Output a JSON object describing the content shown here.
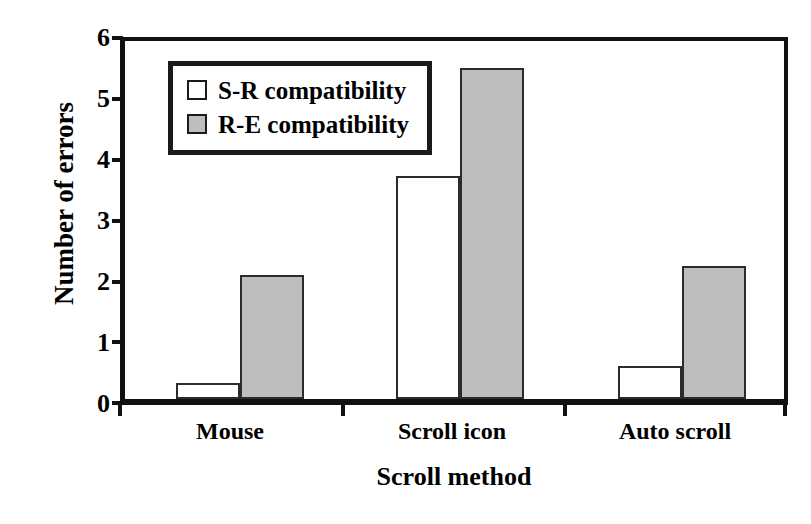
{
  "chart_data": {
    "type": "bar",
    "title": "",
    "xlabel": "Scroll method",
    "ylabel": "Number of errors",
    "categories": [
      "Mouse",
      "Scroll icon",
      "Auto scroll"
    ],
    "series": [
      {
        "name": "S-R compatibility",
        "values": [
          0.26,
          3.65,
          0.53
        ],
        "color": "#ffffff"
      },
      {
        "name": "R-E compatibility",
        "values": [
          2.02,
          5.42,
          2.18
        ],
        "color": "#bebebe"
      }
    ],
    "ylim": [
      0,
      6
    ],
    "yticks": [
      0,
      1,
      2,
      3,
      4,
      5,
      6
    ],
    "ytick_labels": [
      "0",
      "1",
      "2",
      "3",
      "4",
      "5",
      "6"
    ],
    "grid": false,
    "legend_position": "top-left-inside",
    "frame": "full-box",
    "bar_border_color": "#2b2b2b",
    "axis_color": "#111111"
  },
  "axes": {
    "y_title": "Number of errors",
    "x_title": "Scroll method",
    "y_tick_labels": [
      "6",
      "5",
      "4",
      "3",
      "2",
      "1",
      "0"
    ],
    "x_tick_labels": [
      "Mouse",
      "Scroll icon",
      "Auto scroll"
    ]
  },
  "legend": {
    "entries": [
      {
        "label": "S-R compatibility",
        "swatch": "white-square"
      },
      {
        "label": "R-E compatibility",
        "swatch": "gray-square"
      }
    ]
  }
}
